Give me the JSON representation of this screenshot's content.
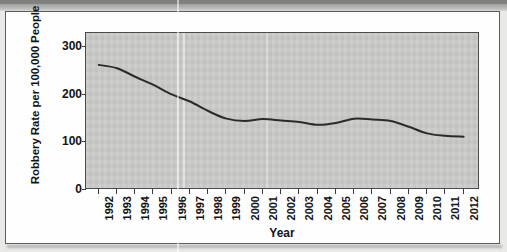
{
  "figure": {
    "axis_titles": {
      "y": "Robbery Rate per 100,000 People",
      "x": "Year"
    }
  },
  "chart_data": {
    "type": "line",
    "title": "",
    "xlabel": "Year",
    "ylabel": "Robbery Rate per 100,000 People",
    "categories": [
      "1992",
      "1993",
      "1994",
      "1995",
      "1996",
      "1997",
      "1998",
      "1999",
      "2000",
      "2001",
      "2002",
      "2003",
      "2004",
      "2005",
      "2006",
      "2007",
      "2008",
      "2009",
      "2010",
      "2011",
      "2012"
    ],
    "x": [
      1992,
      1993,
      1994,
      1995,
      1996,
      1997,
      1998,
      1999,
      2000,
      2001,
      2002,
      2003,
      2004,
      2005,
      2006,
      2007,
      2008,
      2009,
      2010,
      2011,
      2012
    ],
    "values": [
      263,
      256,
      238,
      221,
      201,
      186,
      166,
      150,
      145,
      149,
      146,
      143,
      137,
      141,
      150,
      148,
      145,
      133,
      119,
      114,
      112
    ],
    "series": [
      {
        "name": "Robbery rate",
        "values": [
          263,
          256,
          238,
          221,
          201,
          186,
          166,
          150,
          145,
          149,
          146,
          143,
          137,
          141,
          150,
          148,
          145,
          133,
          119,
          114,
          112
        ]
      }
    ],
    "ylim": [
      0,
      330
    ],
    "yticks": [
      0,
      100,
      200,
      300
    ],
    "ytick_labels": [
      "0",
      "100",
      "200",
      "300"
    ],
    "xlim": [
      1991.3,
      2012.9
    ],
    "grid": false,
    "legend": "none",
    "line_color": "#2b2b2b",
    "plot_background": "#c9c9c7",
    "marker": "none"
  }
}
